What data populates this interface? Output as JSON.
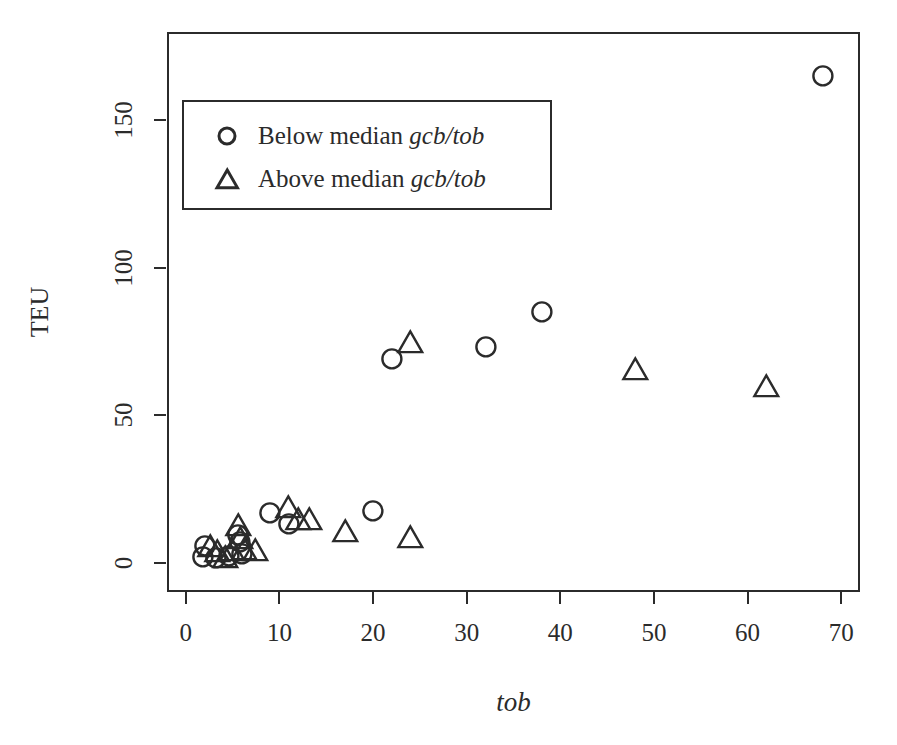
{
  "chart_data": {
    "type": "scatter",
    "title": "",
    "xlabel": "tob",
    "ylabel": "TEU",
    "xlim": [
      -2,
      72
    ],
    "ylim": [
      -10,
      180
    ],
    "xticks": [
      0,
      10,
      20,
      30,
      40,
      50,
      60,
      70
    ],
    "yticks": [
      0,
      50,
      100,
      150
    ],
    "xtick_labels": [
      "0",
      "10",
      "20",
      "30",
      "40",
      "50",
      "60",
      "70"
    ],
    "ytick_labels": [
      "0",
      "50",
      "100",
      "150"
    ],
    "grid": false,
    "legend_position": "top-left",
    "series": [
      {
        "name": "Below median gcb/tob",
        "marker": "circle",
        "color": "#2b2b2b",
        "points": [
          {
            "x": 1.8,
            "y": 2.0
          },
          {
            "x": 2.0,
            "y": 5.5
          },
          {
            "x": 3.2,
            "y": 1.5
          },
          {
            "x": 4.6,
            "y": 2.2
          },
          {
            "x": 5.6,
            "y": 9.5
          },
          {
            "x": 5.8,
            "y": 7.0
          },
          {
            "x": 6.0,
            "y": 3.0
          },
          {
            "x": 9.0,
            "y": 17.0
          },
          {
            "x": 11.0,
            "y": 13.0
          },
          {
            "x": 20.0,
            "y": 17.5
          },
          {
            "x": 22.0,
            "y": 69.0
          },
          {
            "x": 32.0,
            "y": 73.0
          },
          {
            "x": 38.0,
            "y": 85.0
          },
          {
            "x": 68.0,
            "y": 165.0
          }
        ]
      },
      {
        "name": "Above median gcb/tob",
        "marker": "triangle",
        "color": "#2b2b2b",
        "points": [
          {
            "x": 2.6,
            "y": 5.0
          },
          {
            "x": 3.4,
            "y": 3.0
          },
          {
            "x": 4.2,
            "y": 1.0
          },
          {
            "x": 5.0,
            "y": 3.5
          },
          {
            "x": 5.6,
            "y": 12.0
          },
          {
            "x": 5.8,
            "y": 7.5
          },
          {
            "x": 6.2,
            "y": 4.0
          },
          {
            "x": 7.4,
            "y": 3.5
          },
          {
            "x": 11.0,
            "y": 18.0
          },
          {
            "x": 12.0,
            "y": 14.0
          },
          {
            "x": 13.2,
            "y": 14.0
          },
          {
            "x": 17.0,
            "y": 10.0
          },
          {
            "x": 24.0,
            "y": 8.0
          },
          {
            "x": 24.0,
            "y": 74.0
          },
          {
            "x": 48.0,
            "y": 65.0
          },
          {
            "x": 62.0,
            "y": 59.0
          }
        ]
      }
    ]
  },
  "legend": {
    "entries": [
      {
        "symbol": "circle",
        "prefix": "Below median ",
        "italic": "gcb/tob"
      },
      {
        "symbol": "triangle",
        "prefix": "Above median ",
        "italic": "gcb/tob"
      }
    ]
  },
  "colors": {
    "foreground": "#2b2b2b",
    "background": "#ffffff"
  }
}
